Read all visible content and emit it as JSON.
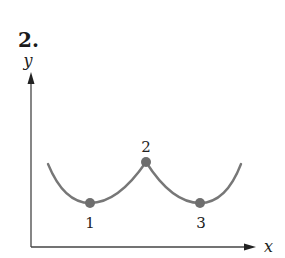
{
  "problem": {
    "number": "2."
  },
  "axes": {
    "x_label": "x",
    "y_label": "y"
  },
  "points": [
    {
      "label": "1",
      "x": 90,
      "y": 203
    },
    {
      "label": "2",
      "x": 146,
      "y": 162
    },
    {
      "label": "3",
      "x": 200,
      "y": 203
    }
  ],
  "colors": {
    "curve": "#777777",
    "point": "#6e6e6e",
    "axis": "#444444"
  }
}
